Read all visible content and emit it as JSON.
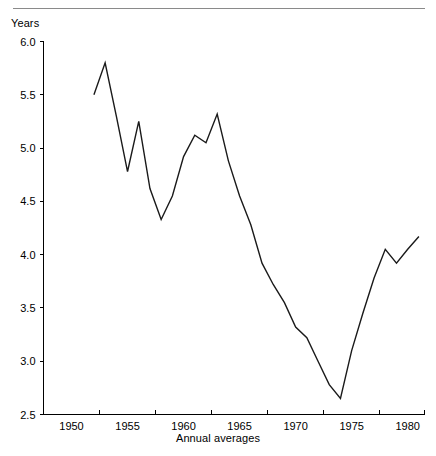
{
  "figure": {
    "y_axis_title": "Years",
    "x_axis_title": "Annual averages"
  },
  "chart_data": {
    "type": "line",
    "title": "",
    "subtitle": "",
    "xlabel": "Annual averages",
    "ylabel": "Years",
    "xlim": [
      1947.5,
      1981.5
    ],
    "ylim": [
      2.5,
      6.0
    ],
    "grid": false,
    "legend": null,
    "x_tick_labels": [
      "1950",
      "1955",
      "1960",
      "1965",
      "1970",
      "1975",
      "1980"
    ],
    "x_tick_values": [
      1950,
      1955,
      1960,
      1965,
      1970,
      1975,
      1980
    ],
    "x_tick_mark_values": [
      1952.5,
      1957.5,
      1962.5,
      1967.5,
      1972.5,
      1977.5,
      1981.5
    ],
    "y_tick_labels": [
      "2.5",
      "3.0",
      "3.5",
      "4.0",
      "4.5",
      "5.0",
      "5.5",
      "6.0"
    ],
    "y_tick_values": [
      2.5,
      3.0,
      3.5,
      4.0,
      4.5,
      5.0,
      5.5,
      6.0
    ],
    "series": [
      {
        "name": "Years",
        "x": [
          1952,
          1953,
          1954,
          1955,
          1956,
          1957,
          1958,
          1959,
          1960,
          1961,
          1962,
          1963,
          1964,
          1965,
          1966,
          1967,
          1968,
          1969,
          1970,
          1971,
          1972,
          1973,
          1974,
          1975,
          1976,
          1977,
          1978,
          1979,
          1980,
          1981
        ],
        "values": [
          5.5,
          5.8,
          5.3,
          4.78,
          5.25,
          4.62,
          4.33,
          4.55,
          4.92,
          5.12,
          5.05,
          5.32,
          4.88,
          4.55,
          4.28,
          3.92,
          3.72,
          3.55,
          3.32,
          3.22,
          3.0,
          2.78,
          2.65,
          3.1,
          3.45,
          3.78,
          4.05,
          3.92,
          4.05,
          4.17
        ]
      }
    ]
  }
}
